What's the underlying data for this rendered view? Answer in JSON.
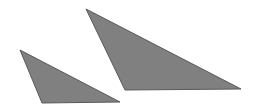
{
  "canvas": {
    "width": 256,
    "height": 110,
    "background_color": "#ffffff",
    "name": "two-triangles-figure"
  },
  "palette": {
    "fill": "#808080",
    "stroke": "#595959",
    "background": "#ffffff"
  },
  "shapes": [
    {
      "id": "small-triangle",
      "label": "small-triangle",
      "kind": "triangle",
      "fill": "#808080",
      "stroke": "#595959",
      "stroke_width": 1,
      "points": "20,50 42,103 120,102",
      "vertices": [
        {
          "name": "apex-top-left",
          "x": 20,
          "y": 50
        },
        {
          "name": "bottom-left",
          "x": 42,
          "y": 103
        },
        {
          "name": "right-tip",
          "x": 120,
          "y": 102
        }
      ]
    },
    {
      "id": "large-triangle",
      "label": "large-triangle",
      "kind": "triangle",
      "fill": "#808080",
      "stroke": "#595959",
      "stroke_width": 1,
      "points": "86,9 125,90 241,89",
      "vertices": [
        {
          "name": "apex-top-left",
          "x": 86,
          "y": 9
        },
        {
          "name": "bottom-left",
          "x": 125,
          "y": 90
        },
        {
          "name": "right-tip",
          "x": 241,
          "y": 89
        }
      ]
    }
  ]
}
